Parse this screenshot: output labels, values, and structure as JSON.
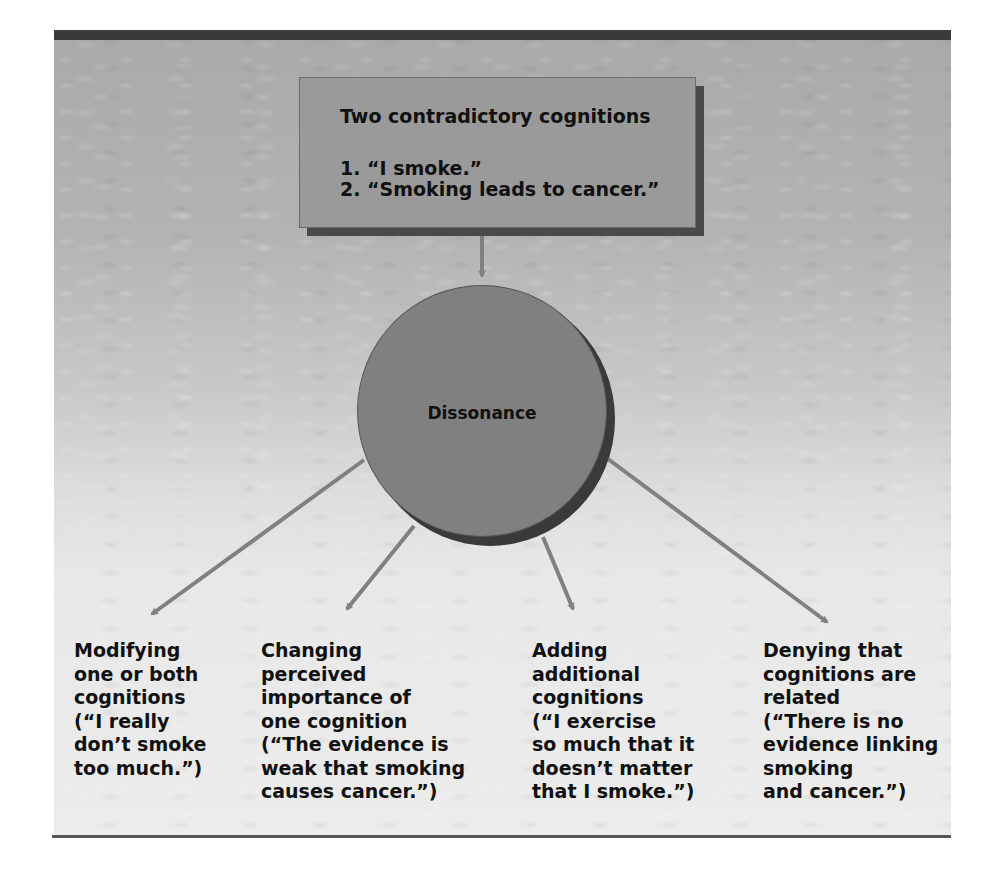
{
  "figure": {
    "source_box": {
      "title": "Two contradictory cognitions",
      "items": [
        "1. “I smoke.”",
        "2. “Smoking leads to cancer.”"
      ]
    },
    "center_node": {
      "label": "Dissonance"
    },
    "strategies": [
      {
        "lines": [
          "Modifying",
          "one or both",
          "cognitions",
          "(“I really",
          "don’t smoke",
          "too much.”)"
        ]
      },
      {
        "lines": [
          "Changing",
          "perceived",
          "importance of",
          "one cognition",
          "(“The evidence is",
          "weak that smoking",
          "causes cancer.”)"
        ]
      },
      {
        "lines": [
          "Adding",
          "additional",
          "cognitions",
          "(“I exercise",
          "so much that it",
          "doesn’t matter",
          "that I smoke.”)"
        ]
      },
      {
        "lines": [
          "Denying that",
          "cognitions are",
          "related",
          "(“There is no",
          "evidence linking",
          "smoking",
          "and cancer.”)"
        ]
      }
    ],
    "colors": {
      "box_fill": "#9a9a9a",
      "circle_fill": "#808080",
      "arrow": "#808080",
      "shadow": "#3a3a3a",
      "top_bar": "#3a3a3a"
    }
  }
}
